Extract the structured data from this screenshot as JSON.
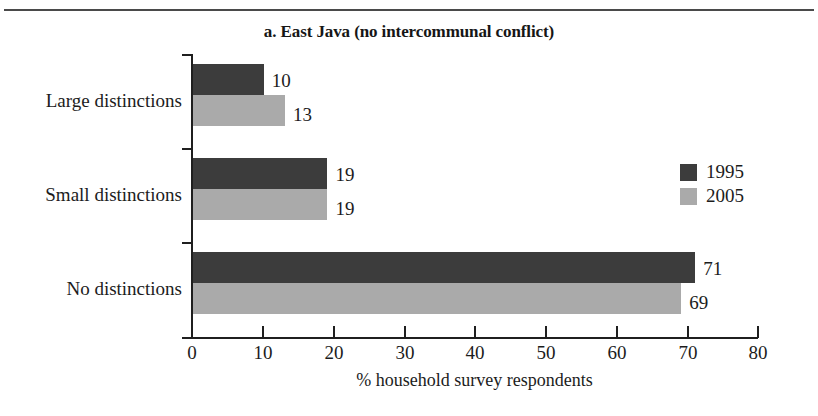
{
  "chart_data": {
    "type": "bar",
    "orientation": "horizontal",
    "title": "a. East Java (no intercommunal conflict)",
    "xlabel": "% household survey respondents",
    "ylabel": "",
    "categories": [
      "Large distinctions",
      "Small distinctions",
      "No distinctions"
    ],
    "series": [
      {
        "name": "1995",
        "color": "#3c3c3c",
        "values": [
          10,
          19,
          71
        ]
      },
      {
        "name": "2005",
        "color": "#aaaaaa",
        "values": [
          13,
          19,
          69
        ]
      }
    ],
    "xlim": [
      0,
      80
    ],
    "xticks": [
      0,
      10,
      20,
      30,
      40,
      50,
      60,
      70,
      80
    ],
    "xtick_labels": [
      "0",
      "10",
      "20",
      "30",
      "40",
      "50",
      "60",
      "70",
      "80"
    ],
    "grid": false,
    "legend_position": "right-middle",
    "data_labels": [
      "10",
      "13",
      "19",
      "19",
      "71",
      "69"
    ]
  },
  "legend": {
    "entries": [
      {
        "label": "1995",
        "color": "#3c3c3c"
      },
      {
        "label": "2005",
        "color": "#aaaaaa"
      }
    ]
  },
  "colors": {
    "series_1995": "#3c3c3c",
    "series_2005": "#aaaaaa",
    "axis": "#1f1f1f",
    "rule": "#4a4a4a",
    "text": "#1c1c1c"
  }
}
